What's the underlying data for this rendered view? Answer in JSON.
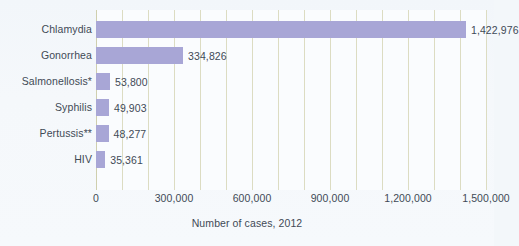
{
  "chart_data": {
    "type": "bar",
    "orientation": "horizontal",
    "title": "",
    "xlabel": "Number of cases, 2012",
    "ylabel": "",
    "categories": [
      "Chlamydia",
      "Gonorrhea",
      "Salmonellosis*",
      "Syphilis",
      "Pertussis**",
      "HIV"
    ],
    "values": [
      1422976,
      334826,
      53800,
      49903,
      48277,
      35361
    ],
    "value_labels": [
      "1,422,976",
      "334,826",
      "53,800",
      "49,903",
      "48,277",
      "35,361"
    ],
    "xlim": [
      0,
      1500000
    ],
    "xticks": [
      0,
      300000,
      600000,
      900000,
      1200000,
      1500000
    ],
    "xtick_labels": [
      "0",
      "300,000",
      "600,000",
      "900,000",
      "1,200,000",
      "1,500,000"
    ],
    "minor_gridline_step": 100000,
    "grid": true,
    "legend": "none",
    "bar_color": "#a8a6d6",
    "gridline_color": "#dcdcc2",
    "text_color": "#3f4a56",
    "background_color": "#f3f7fa",
    "plot_background_color": "#fafcfe"
  }
}
